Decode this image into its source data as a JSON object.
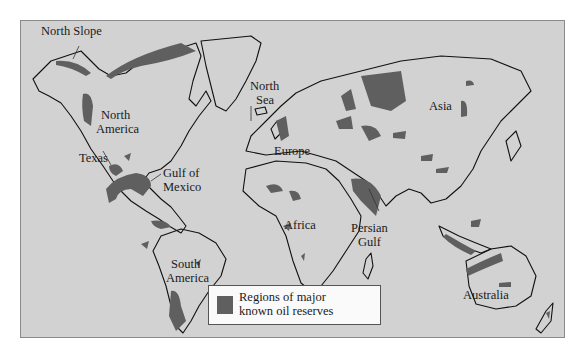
{
  "map": {
    "title": "Regions of major known oil reserves",
    "colors": {
      "ocean": "#d2d2d2",
      "land_outline": "#111111",
      "reserve": "#5f5f5f"
    },
    "labels": [
      {
        "id": "north-slope",
        "text": "North Slope"
      },
      {
        "id": "north-america-1",
        "text": "North"
      },
      {
        "id": "north-america-2",
        "text": "America"
      },
      {
        "id": "texas",
        "text": "Texas"
      },
      {
        "id": "gulf-of-mexico-1",
        "text": "Gulf of"
      },
      {
        "id": "gulf-of-mexico-2",
        "text": "Mexico"
      },
      {
        "id": "south-america-1",
        "text": "South"
      },
      {
        "id": "south-america-2",
        "text": "America"
      },
      {
        "id": "north-sea-1",
        "text": "North"
      },
      {
        "id": "north-sea-2",
        "text": "Sea"
      },
      {
        "id": "europe",
        "text": "Europe"
      },
      {
        "id": "africa",
        "text": "Africa"
      },
      {
        "id": "persian-gulf-1",
        "text": "Persian"
      },
      {
        "id": "persian-gulf-2",
        "text": "Gulf"
      },
      {
        "id": "asia",
        "text": "Asia"
      },
      {
        "id": "australia",
        "text": "Australia"
      }
    ],
    "legend": {
      "line1": "Regions of major",
      "line2": "known oil reserves"
    }
  }
}
